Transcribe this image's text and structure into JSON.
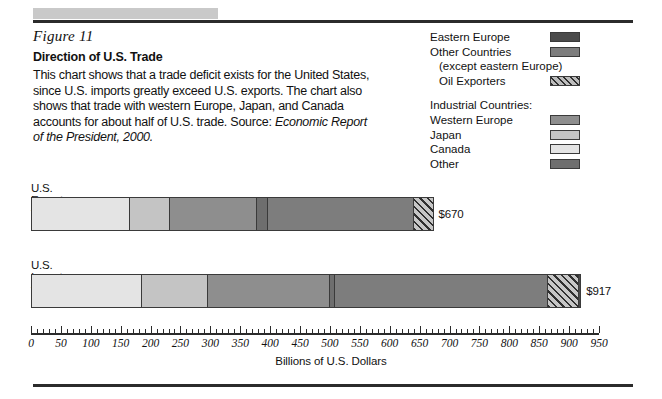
{
  "figure": {
    "label": "Figure 11",
    "title": "Direction of U.S. Trade",
    "body": "This chart shows that a trade deficit exists for the United States, since U.S. imports greatly exceed U.S. exports. The chart also shows that trade with western Europe, Japan, and Canada accounts for about half of U.S. trade. Source:",
    "source_italic": "Economic Report of the President, 2000."
  },
  "legend": {
    "items": [
      {
        "label": "Eastern Europe",
        "color": "#4a4a4a",
        "swatch": "solid"
      },
      {
        "label": "Other Countries",
        "color": "#7d7d7d",
        "swatch": "solid"
      },
      {
        "label": "(except eastern Europe)",
        "color": "",
        "swatch": "none"
      },
      {
        "label": "Oil Exporters",
        "color": "#9a9a9a",
        "swatch": "hatch"
      }
    ],
    "group_heading": "Industrial Countries:",
    "group_items": [
      {
        "label": "Western Europe",
        "color": "#8e8e8e",
        "swatch": "solid"
      },
      {
        "label": "Japan",
        "color": "#c4c4c4",
        "swatch": "solid"
      },
      {
        "label": "Canada",
        "color": "#e4e4e4",
        "swatch": "solid"
      },
      {
        "label": "Other",
        "color": "#6e6e6e",
        "swatch": "solid"
      }
    ]
  },
  "chart_data": {
    "type": "bar",
    "orientation": "horizontal",
    "title": "Direction of U.S. Trade",
    "xlabel": "Billions of U.S. Dollars",
    "ylabel": "",
    "xlim": [
      0,
      950
    ],
    "xticks": [
      0,
      50,
      100,
      150,
      200,
      250,
      300,
      350,
      400,
      450,
      500,
      550,
      600,
      650,
      700,
      750,
      800,
      850,
      900,
      950
    ],
    "xtick_labels": [
      "0",
      "50",
      "100",
      "150",
      "200",
      "250",
      "300",
      "350",
      "400",
      "450",
      "500",
      "550",
      "600",
      "650",
      "700",
      "750",
      "800",
      "850",
      "900",
      "950"
    ],
    "minor_tick_step": 10,
    "grid": false,
    "legend_position": "top-right",
    "categories": [
      "U.S. Exports to:",
      "U.S. Imports from:"
    ],
    "totals": [
      670,
      917
    ],
    "total_labels": [
      "$670",
      "$917"
    ],
    "series": [
      {
        "name": "Canada",
        "color": "#e4e4e4",
        "hatch": false,
        "values": [
          164,
          184
        ]
      },
      {
        "name": "Japan",
        "color": "#c4c4c4",
        "hatch": false,
        "values": [
          68,
          112
        ]
      },
      {
        "name": "Western Europe",
        "color": "#8e8e8e",
        "hatch": false,
        "values": [
          146,
          204
        ]
      },
      {
        "name": "Other",
        "color": "#6e6e6e",
        "hatch": false,
        "values": [
          19,
          8
        ]
      },
      {
        "name": "Other Countries",
        "color": "#7d7d7d",
        "hatch": false,
        "values": [
          245,
          358
        ]
      },
      {
        "name": "Oil Exporters",
        "color": "#9a9a9a",
        "hatch": true,
        "values": [
          31,
          51
        ]
      },
      {
        "name": "Eastern Europe",
        "color": "#4a4a4a",
        "hatch": false,
        "values": [
          0,
          3
        ]
      }
    ]
  }
}
